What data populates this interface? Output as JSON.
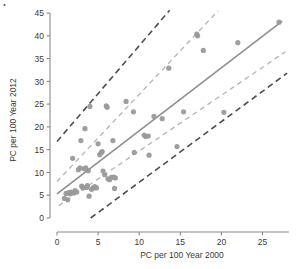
{
  "chart_data": {
    "type": "scatter",
    "title": "",
    "xlabel": "PC per 100 Year 2000",
    "ylabel": "PC per 100 Year 2012",
    "xlim": [
      0,
      28.2
    ],
    "ylim": [
      0,
      46.5
    ],
    "xticks": [
      0,
      5,
      10,
      15,
      20,
      25
    ],
    "xtick_labels": [
      "0",
      "5",
      "10",
      "15",
      "20",
      "25"
    ],
    "yticks": [
      0,
      5,
      10,
      15,
      20,
      25,
      30,
      35,
      40,
      45
    ],
    "ytick_labels": [
      "0",
      "5",
      "10",
      "15",
      "20",
      "25",
      "30",
      "35",
      "40",
      "45"
    ],
    "grid": false,
    "legend": "none",
    "marker_color": "#9a9a9a",
    "fit_line_color": "#8f8f8f",
    "confidence_band_color": "#b4b4b4",
    "prediction_band_color": "#4d4d4d",
    "axis_color": "#8a8a8a",
    "points": [
      [
        0.9,
        4.3
      ],
      [
        1.1,
        5.4
      ],
      [
        1.3,
        4.0
      ],
      [
        1.4,
        5.5
      ],
      [
        1.5,
        5.6
      ],
      [
        1.6,
        5.3
      ],
      [
        1.7,
        5.7
      ],
      [
        1.8,
        5.5
      ],
      [
        1.9,
        13.1
      ],
      [
        2.0,
        5.6
      ],
      [
        2.2,
        6.0
      ],
      [
        2.4,
        5.7
      ],
      [
        2.6,
        10.6
      ],
      [
        2.8,
        11.0
      ],
      [
        2.9,
        17.0
      ],
      [
        3.0,
        7.0
      ],
      [
        3.1,
        6.8
      ],
      [
        3.2,
        6.6
      ],
      [
        3.3,
        10.8
      ],
      [
        3.4,
        19.6
      ],
      [
        3.5,
        11.0
      ],
      [
        3.6,
        6.7
      ],
      [
        3.7,
        7.1
      ],
      [
        3.8,
        10.4
      ],
      [
        3.9,
        4.8
      ],
      [
        4.0,
        24.5
      ],
      [
        4.2,
        6.3
      ],
      [
        4.4,
        6.6
      ],
      [
        4.6,
        6.9
      ],
      [
        4.8,
        6.6
      ],
      [
        5.0,
        16.3
      ],
      [
        5.2,
        13.9
      ],
      [
        5.4,
        14.4
      ],
      [
        5.5,
        14.6
      ],
      [
        5.6,
        10.3
      ],
      [
        5.8,
        9.5
      ],
      [
        6.0,
        24.6
      ],
      [
        6.1,
        24.3
      ],
      [
        6.2,
        8.6
      ],
      [
        6.4,
        8.4
      ],
      [
        6.6,
        8.9
      ],
      [
        6.8,
        17.0
      ],
      [
        6.9,
        9.0
      ],
      [
        7.0,
        6.5
      ],
      [
        7.1,
        8.8
      ],
      [
        8.4,
        25.6
      ],
      [
        9.3,
        23.3
      ],
      [
        9.4,
        14.4
      ],
      [
        10.6,
        18.2
      ],
      [
        10.8,
        17.9
      ],
      [
        11.1,
        18.0
      ],
      [
        11.2,
        13.8
      ],
      [
        11.8,
        22.3
      ],
      [
        12.8,
        21.8
      ],
      [
        13.6,
        32.9
      ],
      [
        14.6,
        15.7
      ],
      [
        15.4,
        23.3
      ],
      [
        17.0,
        40.4
      ],
      [
        17.1,
        40.0
      ],
      [
        17.8,
        36.8
      ],
      [
        20.3,
        23.2
      ],
      [
        22.0,
        38.5
      ],
      [
        27.0,
        43.0
      ]
    ],
    "fit_line": {
      "x": [
        0.0,
        27.4
      ],
      "y": [
        5.3,
        43.2
      ]
    },
    "confidence_bands": [
      {
        "name": "upper",
        "x": [
          0.0,
          19.6
        ],
        "y": [
          8.0,
          45.5
        ]
      },
      {
        "name": "lower",
        "x": [
          0.2,
          27.8
        ],
        "y": [
          2.7,
          36.5
        ]
      }
    ],
    "prediction_bands": [
      {
        "name": "upper",
        "x": [
          0.0,
          13.7
        ],
        "y": [
          16.8,
          45.6
        ]
      },
      {
        "name": "lower",
        "x": [
          4.1,
          28.0
        ],
        "y": [
          0.0,
          31.8
        ]
      }
    ]
  }
}
